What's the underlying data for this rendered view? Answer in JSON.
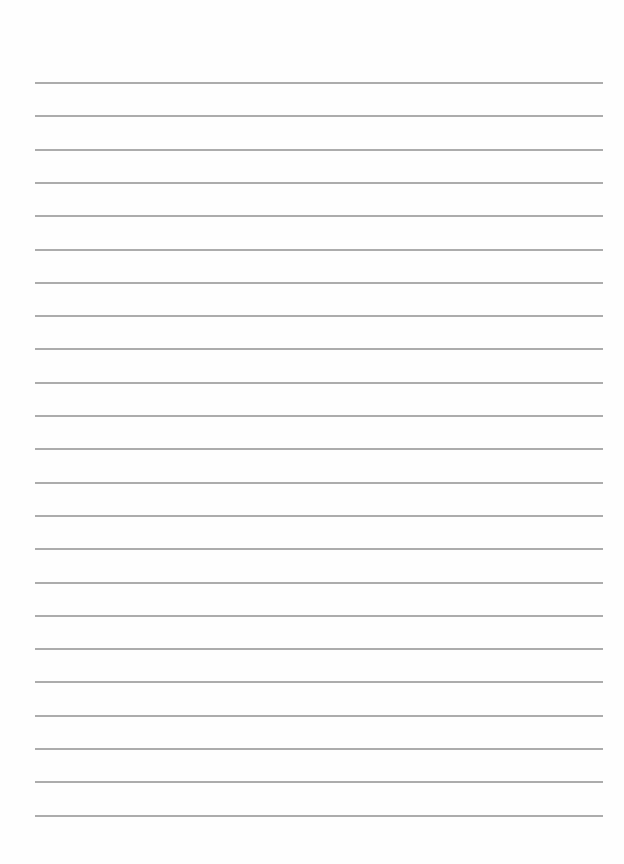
{
  "page": {
    "type": "lined-paper",
    "background_color": "#fefefe",
    "line_color": "#9e9e9e",
    "line_count": 23,
    "first_line_y": 82,
    "line_spacing": 33.3,
    "line_left_x": 35,
    "line_right_x": 603,
    "text": []
  }
}
